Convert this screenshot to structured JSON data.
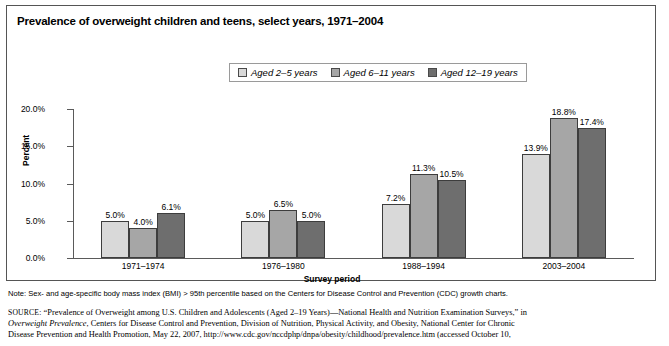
{
  "figure": {
    "title": "Prevalence of overweight children and teens, select years, 1971–2004",
    "note": "Note: Sex- and age-specific body mass index (BMI) > 95th percentile based on the Centers for Disease Control and Prevention (CDC) growth charts.",
    "source_prefix": "SOURCE:",
    "source_line1": "“Prevalence of Overweight among U.S. Children and  Adolescents (Aged 2–19 Years)—National Health and Nutrition Examination Surveys,” in",
    "source_line2_italic": "Overweight Prevalence",
    "source_line2_rest": ", Centers for Disease Control and Prevention, Division of Nutrition, Physical Activity, and Obesity, National Center for Chronic",
    "source_line3": "Disease Prevention and Health Promotion, May 22, 2007, http://www.cdc.gov/nccdphp/dnpa/obesity/childhood/prevalence.htm (accessed October 10,"
  },
  "legend": {
    "items": [
      {
        "label": "Aged 2–5 years",
        "color": "#d9d9d9"
      },
      {
        "label": "Aged 6–11 years",
        "color": "#a6a6a6"
      },
      {
        "label": "Aged 12–19 years",
        "color": "#6e6e6e"
      }
    ]
  },
  "chart_data": {
    "type": "bar",
    "title": "Prevalence of overweight children and teens, select years, 1971–2004",
    "xlabel": "Survey period",
    "ylabel": "Percent",
    "categories": [
      "1971–1974",
      "1976–1980",
      "1988–1994",
      "2003–2004"
    ],
    "ylim": [
      0,
      20
    ],
    "ytick_labels": [
      "0.0%",
      "5.0%",
      "10.0%",
      "15.0%",
      "20.0%"
    ],
    "ytick_values": [
      0,
      5,
      10,
      15,
      20
    ],
    "grid": false,
    "legend_position": "top-center",
    "series": [
      {
        "name": "Aged 2–5 years",
        "color": "#d9d9d9",
        "values": [
          5.0,
          5.0,
          7.2,
          13.9
        ],
        "labels": [
          "5.0%",
          "5.0%",
          "7.2%",
          "13.9%"
        ]
      },
      {
        "name": "Aged 6–11 years",
        "color": "#a6a6a6",
        "values": [
          4.0,
          6.5,
          11.3,
          18.8
        ],
        "labels": [
          "4.0%",
          "6.5%",
          "11.3%",
          "18.8%"
        ]
      },
      {
        "name": "Aged 12–19 years",
        "color": "#6e6e6e",
        "values": [
          6.1,
          5.0,
          10.5,
          17.4
        ],
        "labels": [
          "6.1%",
          "5.0%",
          "10.5%",
          "17.4%"
        ]
      }
    ]
  }
}
